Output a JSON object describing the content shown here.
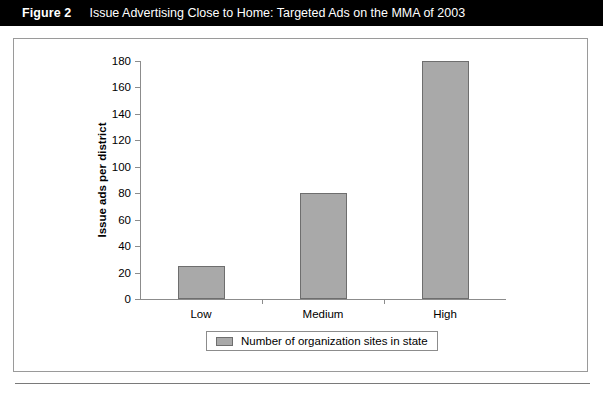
{
  "figure": {
    "number": "Figure 2",
    "caption": "Issue Advertising Close to Home: Targeted Ads on the MMA of 2003"
  },
  "chart_data": {
    "type": "bar",
    "title": "Issue Advertising Close to Home: Targeted Ads on the MMA of 2003",
    "categories": [
      "Low",
      "Medium",
      "High"
    ],
    "values": [
      25,
      80,
      180
    ],
    "series": [
      {
        "name": "Number of organization sites in state",
        "values": [
          25,
          80,
          180
        ]
      }
    ],
    "xlabel": "",
    "ylabel": "Issue ads per district",
    "ylim": [
      0,
      180
    ],
    "ytick_step": 20,
    "yticks": [
      0,
      20,
      40,
      60,
      80,
      100,
      120,
      140,
      160,
      180
    ],
    "ytick_labels": [
      "0",
      "20",
      "40",
      "60",
      "80",
      "100",
      "120",
      "140",
      "160",
      "180"
    ],
    "grid": false,
    "legend": {
      "position": "bottom",
      "entries": [
        "Number of organization sites in state"
      ]
    },
    "colors": {
      "bar_fill": "#a9a9a9",
      "bar_edge": "#6e6e6e",
      "axis": "#8c8c8c",
      "title_bar_background": "#000000",
      "title_bar_text": "#ffffff",
      "plot_background": "#ffffff"
    }
  }
}
